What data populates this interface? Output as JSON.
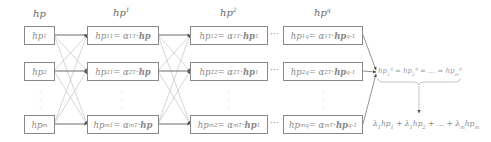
{
  "headers": {
    "col0": "hp",
    "col1_base": "hp",
    "col1_sup": "1",
    "col2_base": "hp",
    "col2_sup": "2",
    "col3_base": "hp",
    "col3_sup": "q"
  },
  "columns": [
    {
      "rows": [
        {
          "lhs": "hp",
          "sub": "1"
        },
        {
          "lhs": "hp",
          "sub": "2"
        },
        {
          "lhs": "hp",
          "sub": "m"
        }
      ]
    },
    {
      "rows": [
        {
          "lhs": "hp",
          "sub": "1",
          "sup": "1",
          "eq": " = α",
          "asub": "1",
          "asup": "T",
          "rhs": "· ",
          "rhs_b": "hp",
          "rhs_sup": ""
        },
        {
          "lhs": "hp",
          "sub": "2",
          "sup": "1",
          "eq": " = α",
          "asub": "2",
          "asup": "T",
          "rhs": "· ",
          "rhs_b": "hp",
          "rhs_sup": ""
        },
        {
          "lhs": "hp",
          "sub": "m",
          "sup": "1",
          "eq": " = α",
          "asub": "m",
          "asup": "T",
          "rhs": "· ",
          "rhs_b": "hp",
          "rhs_sup": ""
        }
      ]
    },
    {
      "rows": [
        {
          "lhs": "hp",
          "sub": "1",
          "sup": "2",
          "eq": " = α",
          "asub": "1",
          "asup": "T",
          "rhs": "· ",
          "rhs_b": "hp",
          "rhs_sup": "1"
        },
        {
          "lhs": "hp",
          "sub": "2",
          "sup": "2",
          "eq": " = α",
          "asub": "2",
          "asup": "T",
          "rhs": "· ",
          "rhs_b": "hp",
          "rhs_sup": "1"
        },
        {
          "lhs": "hp",
          "sub": "m",
          "sup": "2",
          "eq": " = α",
          "asub": "m",
          "asup": "T",
          "rhs": "· ",
          "rhs_b": "hp",
          "rhs_sup": "1"
        }
      ]
    },
    {
      "rows": [
        {
          "lhs": "hp",
          "sub": "1",
          "sup": "q",
          "eq": " = α",
          "asub": "1",
          "asup": "T",
          "rhs": "· ",
          "rhs_b": "hp",
          "rhs_sup": "q-1"
        },
        {
          "lhs": "hp",
          "sub": "2",
          "sup": "q",
          "eq": " = α",
          "asub": "2",
          "asup": "T",
          "rhs": "· ",
          "rhs_b": "hp",
          "rhs_sup": "q-1"
        },
        {
          "lhs": "hp",
          "sub": "m",
          "sup": "q",
          "eq": " = α",
          "asub": "m",
          "asup": "T",
          "rhs": "· ",
          "rhs_b": "hp",
          "rhs_sup": "q-1"
        }
      ]
    }
  ],
  "ellipsis": "···",
  "vdots": "·",
  "convergence": {
    "t1": "hp",
    "s1": "1",
    "p1": "q",
    "approx": " ≈ ",
    "t2": "hp",
    "s2": "2",
    "p2": "q",
    "mid": " ≈ … ≈ ",
    "t3": "hp",
    "s3": "m",
    "p3": "q"
  },
  "result": {
    "l1": "λ",
    "ls1": "1",
    "h1": "hp",
    "hs1": "1",
    "plus1": " + ",
    "l2": "λ",
    "ls2": "1",
    "h2": "hp",
    "hs2": "2",
    "plus2": " + … + ",
    "l3": "λ",
    "ls3": "m",
    "h3": "hp",
    "hs3": "m"
  },
  "colors": {
    "box_border": "#888888",
    "link": "#aaaaaa",
    "arrow_head": "#555555",
    "text": "#777777"
  }
}
